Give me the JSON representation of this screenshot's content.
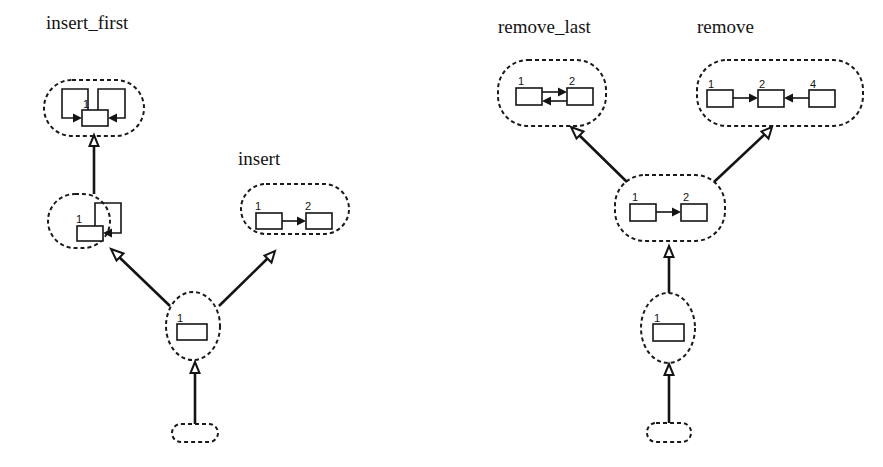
{
  "diagram": {
    "type": "state-transition-graph",
    "colors": {
      "ink": "#141414",
      "background": "#ffffff"
    },
    "left_graph": {
      "titles": {
        "insert_first": "insert_first",
        "insert": "insert"
      },
      "states": [
        {
          "id": "L0",
          "description": "empty list",
          "nodes": []
        },
        {
          "id": "L1",
          "description": "single node",
          "node_labels": [
            "1"
          ]
        },
        {
          "id": "L2",
          "description": "single node with self loop",
          "node_labels": [
            "1"
          ]
        },
        {
          "id": "L3",
          "description": "single node with two self loops (insert_first)",
          "node_labels": [
            "1"
          ]
        },
        {
          "id": "L4",
          "description": "two nodes 1 -> 2 (insert)",
          "node_labels": [
            "1",
            "2"
          ]
        }
      ],
      "edges": [
        {
          "from": "L0",
          "to": "L1"
        },
        {
          "from": "L1",
          "to": "L2"
        },
        {
          "from": "L2",
          "to": "L3"
        },
        {
          "from": "L1",
          "to": "L4"
        }
      ]
    },
    "right_graph": {
      "titles": {
        "remove_last": "remove_last",
        "remove": "remove"
      },
      "states": [
        {
          "id": "R0",
          "description": "empty list",
          "nodes": []
        },
        {
          "id": "R1",
          "description": "single node",
          "node_labels": [
            "1"
          ]
        },
        {
          "id": "R2",
          "description": "two nodes 1 -> 2",
          "node_labels": [
            "1",
            "2"
          ]
        },
        {
          "id": "R3",
          "description": "two nodes 1 <-> 2 (remove_last)",
          "node_labels": [
            "1",
            "2"
          ]
        },
        {
          "id": "R4",
          "description": "three nodes 1 -> 2 <- 4 (remove)",
          "node_labels": [
            "1",
            "2",
            "4"
          ]
        }
      ],
      "edges": [
        {
          "from": "R0",
          "to": "R1"
        },
        {
          "from": "R1",
          "to": "R2"
        },
        {
          "from": "R2",
          "to": "R3"
        },
        {
          "from": "R2",
          "to": "R4"
        }
      ]
    },
    "labels": {
      "n1": "1",
      "n2": "2",
      "n4": "4"
    }
  }
}
